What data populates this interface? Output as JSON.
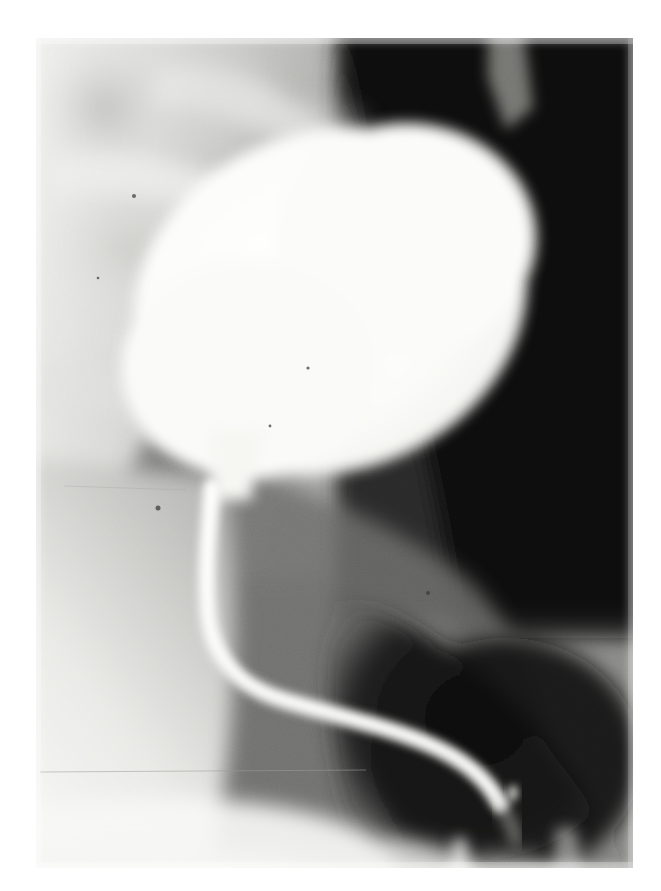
{
  "document": {
    "kind": "radiograph",
    "modality": "X-ray fluoroscopic spot film",
    "study": "Voiding cystourethrogram (VCUG)",
    "projection": "Oblique",
    "background_color": "#ffffff",
    "film_border": {
      "left": 36,
      "top": 38,
      "width": 597,
      "height": 830
    }
  },
  "image_content": {
    "overall_description": "Grainy black-and-white contrast radiograph of the pelvis showing a large, brightly opacified oval bladder in the upper-centre, tapering inferiorly into a narrow contrast-filled urethra that descends and curves in an S shape toward the lower right.",
    "tone_map": {
      "brightest": "#fbfbfa",
      "bright_tissue": "#e4e4e2",
      "mid_tissue": "#9b9b99",
      "dark_tissue": "#4a4a49",
      "darkest": "#0b0b0b"
    },
    "regions": [
      {
        "name": "bladder",
        "label": "Contrast-filled urinary bladder",
        "shape": "oval / egg-shaped, tilted with long axis running upper-right to lower-left",
        "center": [
          330,
          300
        ],
        "radius_x": 200,
        "radius_y": 168,
        "rotation_deg": -18,
        "brightness": "#fbfbfa"
      },
      {
        "name": "bladder-neck",
        "label": "Bladder neck / funnel",
        "center": [
          222,
          490
        ],
        "brightness": "#f0f0ee"
      },
      {
        "name": "urethra",
        "label": "Opacified urethra descending in an S-shaped curve",
        "path_points": [
          [
            208,
            500
          ],
          [
            206,
            600
          ],
          [
            230,
            668
          ],
          [
            300,
            700
          ],
          [
            400,
            725
          ],
          [
            470,
            770
          ],
          [
            500,
            800
          ]
        ],
        "width_px": 15,
        "brightness": "#f2f2ef"
      },
      {
        "name": "pelvic-bone-upper-left",
        "label": "Pelvic / sacral bone shadows",
        "center": [
          160,
          130
        ],
        "brightness": "#d2d2cf"
      },
      {
        "name": "soft-tissue-left",
        "label": "Bright soft-tissue region (left thigh / gluteal fold)",
        "center": [
          95,
          640
        ],
        "brightness": "#efefed"
      },
      {
        "name": "air-dark-right",
        "label": "Dark gas / air-filled region, right of bladder",
        "center": [
          540,
          380
        ],
        "brightness": "#0b0b0b"
      },
      {
        "name": "perineal-dark-band",
        "label": "Dark perineal / soft-tissue band along the lower right",
        "center": [
          440,
          800
        ],
        "brightness": "#171717"
      },
      {
        "name": "bright-speck",
        "label": "Small bright speck lateral to the distal urethra",
        "center": [
          513,
          793
        ],
        "radius": 5,
        "brightness": "#d8d8d4"
      },
      {
        "name": "scratch-line",
        "label": "Faint horizontal film scratch",
        "y": 772,
        "x_start": 40,
        "x_end": 360
      }
    ]
  }
}
